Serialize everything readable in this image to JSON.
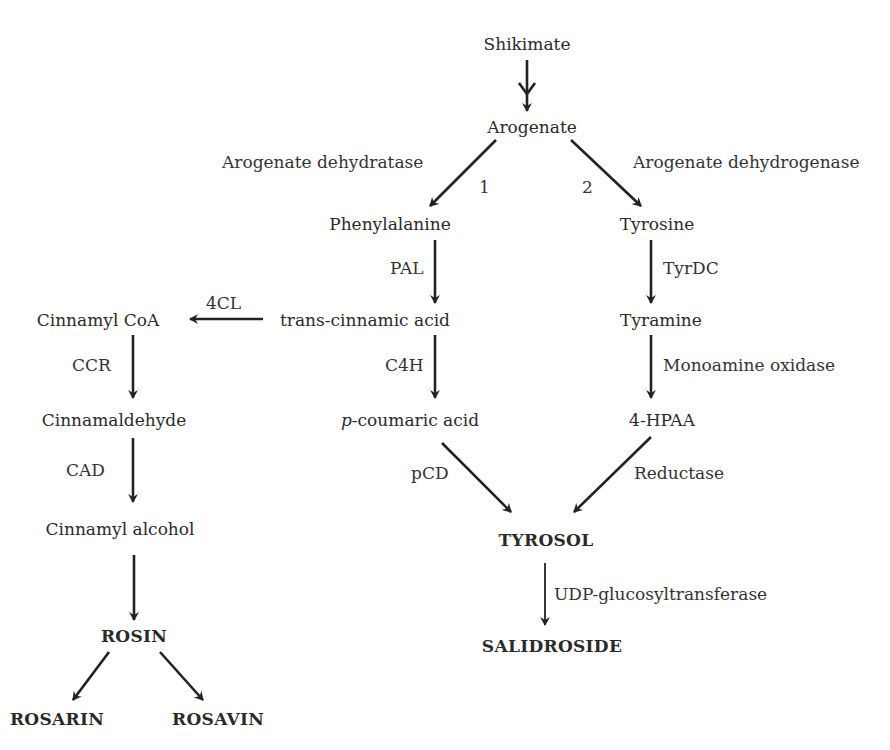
{
  "diagram": {
    "type": "biosynthetic-pathway",
    "nodes": {
      "shikimate": "Shikimate",
      "arogenate": "Arogenate",
      "phenylalanine": "Phenylalanine",
      "tyrosine": "Tyrosine",
      "trans_cinnamic_acid": "trans-cinnamic acid",
      "tyramine": "Tyramine",
      "cinnamyl_coa": "Cinnamyl CoA",
      "p_coumaric_prefix": "p",
      "p_coumaric_rest": "-coumaric acid",
      "hpaa": "4-HPAA",
      "cinnamaldehyde": "Cinnamaldehyde",
      "cinnamyl_alcohol": "Cinnamyl alcohol",
      "tyrosol": "TYROSOL",
      "salidroside": "SALIDROSIDE",
      "rosin": "ROSIN",
      "rosarin": "ROSARIN",
      "rosavin": "ROSAVIN"
    },
    "enzymes": {
      "arogenate_dehydratase": "Arogenate dehydratase",
      "arogenate_dehydrogenase": "Arogenate dehydrogenase",
      "route_1": "1",
      "route_2": "2",
      "pal": "PAL",
      "tyrdc": "TyrDC",
      "fourcl": "4CL",
      "c4h": "C4H",
      "monoamine_oxidase": "Monoamine oxidase",
      "ccr": "CCR",
      "cad": "CAD",
      "pcd": "pCD",
      "reductase": "Reductase",
      "udp_gt": "UDP-glucosyltransferase"
    },
    "edges": [
      {
        "from": "Shikimate",
        "to": "Arogenate",
        "note": "multi-step (double arrowhead)"
      },
      {
        "from": "Arogenate",
        "to": "Phenylalanine",
        "enzyme": "Arogenate dehydratase",
        "route": "1"
      },
      {
        "from": "Arogenate",
        "to": "Tyrosine",
        "enzyme": "Arogenate dehydrogenase",
        "route": "2"
      },
      {
        "from": "Phenylalanine",
        "to": "trans-cinnamic acid",
        "enzyme": "PAL"
      },
      {
        "from": "trans-cinnamic acid",
        "to": "Cinnamyl CoA",
        "enzyme": "4CL"
      },
      {
        "from": "trans-cinnamic acid",
        "to": "p-coumaric acid",
        "enzyme": "C4H"
      },
      {
        "from": "Cinnamyl CoA",
        "to": "Cinnamaldehyde",
        "enzyme": "CCR"
      },
      {
        "from": "Cinnamaldehyde",
        "to": "Cinnamyl alcohol",
        "enzyme": "CAD"
      },
      {
        "from": "Cinnamyl alcohol",
        "to": "ROSIN"
      },
      {
        "from": "ROSIN",
        "to": "ROSARIN"
      },
      {
        "from": "ROSIN",
        "to": "ROSAVIN"
      },
      {
        "from": "Tyrosine",
        "to": "Tyramine",
        "enzyme": "TyrDC"
      },
      {
        "from": "Tyramine",
        "to": "4-HPAA",
        "enzyme": "Monoamine oxidase"
      },
      {
        "from": "p-coumaric acid",
        "to": "TYROSOL",
        "enzyme": "pCD"
      },
      {
        "from": "4-HPAA",
        "to": "TYROSOL",
        "enzyme": "Reductase"
      },
      {
        "from": "TYROSOL",
        "to": "SALIDROSIDE",
        "enzyme": "UDP-glucosyltransferase"
      }
    ]
  }
}
